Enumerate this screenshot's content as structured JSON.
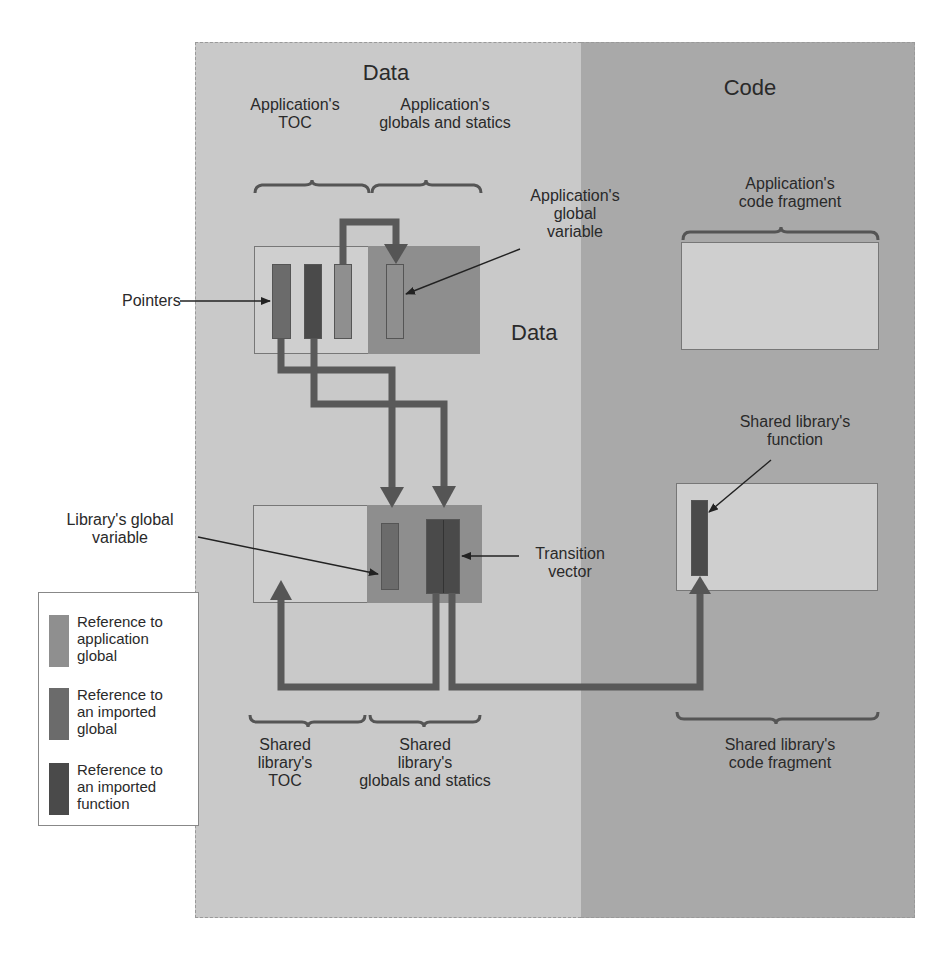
{
  "regions": {
    "data": {
      "title": "Data"
    },
    "code": {
      "title": "Code"
    }
  },
  "application": {
    "toc_label": "Application's\nTOC",
    "toc_label_l1": "Application's",
    "toc_label_l2": "TOC",
    "globals_label_l1": "Application's",
    "globals_label_l2": "globals and statics",
    "global_variable_label_l1": "Application's",
    "global_variable_label_l2": "global",
    "global_variable_label_l3": "variable",
    "pointers_label": "Pointers",
    "data_label": "Data",
    "code_fragment_label_l1": "Application's",
    "code_fragment_label_l2": "code fragment"
  },
  "shared_library": {
    "global_variable_label_l1": "Library's global",
    "global_variable_label_l2": "variable",
    "transition_vector_label_l1": "Transition",
    "transition_vector_label_l2": "vector",
    "function_label_l1": "Shared library's",
    "function_label_l2": "function",
    "toc_label_l1": "Shared",
    "toc_label_l2": "library's",
    "toc_label_l3": "TOC",
    "globals_label_l1": "Shared",
    "globals_label_l2": "library's",
    "globals_label_l3": "globals and statics",
    "code_fragment_label_l1": "Shared library's",
    "code_fragment_label_l2": "code fragment"
  },
  "legend": {
    "items": [
      {
        "l1": "Reference to",
        "l2": "application",
        "l3": "global",
        "color": "#8f8f8f"
      },
      {
        "l1": "Reference to",
        "l2": "an imported",
        "l3": "global",
        "color": "#6b6b6b"
      },
      {
        "l1": "Reference to",
        "l2": "an imported",
        "l3": "function",
        "color": "#4a4a4a"
      }
    ]
  },
  "colors": {
    "data_region": "#c9c9c9",
    "code_region": "#a9a9a9",
    "light_box": "#cfcfcf",
    "dark_box": "#8e8e8e",
    "arrow": "#555555"
  }
}
